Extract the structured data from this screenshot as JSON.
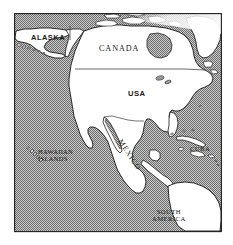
{
  "figure": {
    "kind": "map",
    "projection_note": "stylized halftone world-region map",
    "width": 233,
    "height": 245
  },
  "colors": {
    "page_background": "#ffffff",
    "frame_border": "#1d1d1d",
    "ocean_fill": "#9a9a9a",
    "ocean_dither_light": "#d6d6d6",
    "ocean_dither_dark": "#7d7d7d",
    "land_fill": "#ffffff",
    "coastline_stroke": "#1a1a1a",
    "border_stroke": "#3a3a3a",
    "label_text": "#1a1a1a",
    "corner_wedge": "#f2f2f2"
  },
  "frame": {
    "left": 14,
    "top": 13,
    "right": 222,
    "bottom": 232,
    "stroke_width": 1.1
  },
  "labels": [
    {
      "id": "alaska",
      "text": "ALASKA",
      "style": "bold-sans",
      "rotation": 0,
      "x": 31,
      "y": 34
    },
    {
      "id": "canada",
      "text": "CANADA",
      "style": "serif-spaced",
      "rotation": 0,
      "x": 99,
      "y": 45
    },
    {
      "id": "usa",
      "text": "USA",
      "style": "bold-sans",
      "rotation": 0,
      "x": 128,
      "y": 90
    },
    {
      "id": "mexico",
      "text": "MEXICO",
      "style": "serif-spaced",
      "rotation": 57,
      "x": 123,
      "y": 138
    },
    {
      "id": "hawaiian-islands",
      "line1": "HAWAIIAN",
      "line2": "ISLANDS",
      "style": "serif-small",
      "rotation": 0,
      "x": 38,
      "y": 149
    },
    {
      "id": "cuba",
      "text": "CUBA",
      "style": "serif-small",
      "rotation": 0,
      "x": 190,
      "y": 146
    },
    {
      "id": "south-america",
      "line1": "SOUTH",
      "line2": "AMERICA",
      "style": "serif-small",
      "rotation": 0,
      "x": 152,
      "y": 208
    }
  ],
  "features": {
    "landmasses": [
      "Alaska",
      "Canada",
      "United States of America",
      "Mexico",
      "Central America",
      "Hawaiian Islands",
      "Cuba",
      "Hispaniola",
      "Greenland",
      "Canadian Arctic Archipelago",
      "South America"
    ],
    "water_bodies": [
      "Pacific Ocean",
      "Atlantic Ocean",
      "Gulf of Mexico",
      "Hudson Bay",
      "Caribbean Sea",
      "Arctic Ocean"
    ],
    "political_borders": [
      "Canada-USA 49th parallel",
      "USA-Mexico border"
    ]
  }
}
